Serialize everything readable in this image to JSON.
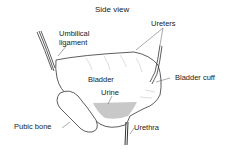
{
  "diagram": {
    "title": "Side view",
    "labels": {
      "umbilical_line1": "Umbilical",
      "umbilical_line2": "ligament",
      "ureters": "Ureters",
      "bladder": "Bladder",
      "bladder_cuff": "Bladder cuff",
      "urine": "Urine",
      "pubic_bone": "Pubic bone",
      "urethra": "Urethra"
    },
    "colors": {
      "line": "#333333",
      "urine_fill": "#c8c8c8",
      "background": "#ffffff"
    }
  }
}
